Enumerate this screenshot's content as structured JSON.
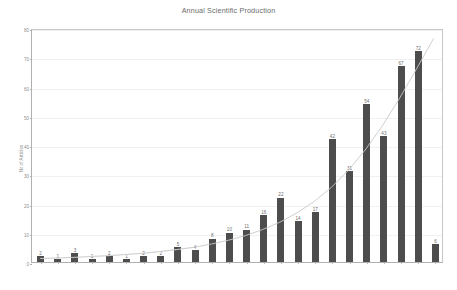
{
  "chart_data": {
    "type": "bar",
    "title": "Annual Scientific Production",
    "xlabel": "",
    "ylabel": "Nr of Articles",
    "ylim": [
      0,
      80
    ],
    "y_ticks": [
      0,
      10,
      20,
      30,
      40,
      50,
      60,
      70,
      80
    ],
    "grid": true,
    "legend": "none",
    "categories": [
      "1988",
      "1998",
      "2000",
      "2001",
      "2002",
      "2003",
      "2004",
      "2005",
      "2006",
      "2007",
      "2008",
      "2009",
      "2010",
      "2011",
      "2012",
      "2013",
      "2014",
      "2015",
      "2016",
      "2017",
      "2018",
      "2019",
      "2020",
      "2021"
    ],
    "values": [
      2,
      1,
      3,
      1,
      2,
      1,
      2,
      2,
      5,
      4,
      8,
      10,
      11,
      16,
      22,
      14,
      17,
      42,
      31,
      54,
      43,
      67,
      72,
      6
    ],
    "series": [
      {
        "name": "Articles per year",
        "values": [
          2,
          1,
          3,
          1,
          2,
          1,
          2,
          2,
          5,
          4,
          8,
          10,
          11,
          16,
          22,
          14,
          17,
          42,
          31,
          54,
          43,
          67,
          72,
          6
        ]
      }
    ],
    "trend_line": {
      "name": "trend",
      "visible": true,
      "values": [
        1.2,
        1.4,
        1.6,
        1.9,
        2.2,
        2.6,
        3.0,
        3.6,
        4.3,
        5.1,
        6.2,
        7.5,
        9.1,
        11.2,
        13.7,
        16.9,
        20.8,
        25.6,
        31.5,
        38.6,
        46.9,
        56.3,
        66.5,
        77.0
      ]
    },
    "colors": {
      "bar": "#4d4d4d",
      "trend": "#c9c9c9",
      "grid": "#f0f0f0",
      "axis": "#b0b0b0",
      "text": "#8f8f8f",
      "title": "#6b6b6b",
      "background": "#ffffff"
    }
  }
}
